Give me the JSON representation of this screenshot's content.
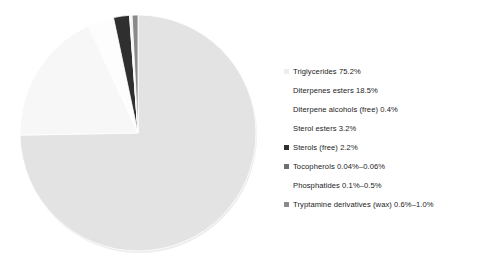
{
  "figure": {
    "background": "#ffffff",
    "pie": {
      "center_x": 120,
      "center_y": 123,
      "radius": 118,
      "start_angle_deg": 0,
      "direction": "clockwise"
    }
  },
  "legend": {
    "position": "right",
    "entries": [
      {
        "label": "Triglycerides 75.2%",
        "color": "#eeeeee",
        "marker": "square",
        "indented": false
      },
      {
        "label": "Diterpenes esters  18.5%",
        "color": "#f8f8f8",
        "marker": "square",
        "indented": true
      },
      {
        "label": "Diterpene alcohols (free) 0.4%",
        "color": "#fbfbfb",
        "marker": "square",
        "indented": true
      },
      {
        "label": "Sterol esters 3.2%",
        "color": "#fdfdfd",
        "marker": "square",
        "indented": true
      },
      {
        "label": "Sterols  (free) 2.2%",
        "color": "#2f2f2f",
        "marker": "square",
        "indented": false
      },
      {
        "label": "Tocopherols 0.04%–0.06%",
        "color": "#6f6f6f",
        "marker": "square",
        "indented": false
      },
      {
        "label": "Phosphatides 0.1%–0.5%",
        "color": "#f2f2f2",
        "marker": "square",
        "indented": true
      },
      {
        "label": "Tryptamine derivatives (wax) 0.6%–1.0%",
        "color": "#8a8a8a",
        "marker": "square",
        "indented": false
      }
    ]
  },
  "chart_data": {
    "type": "pie",
    "title": "",
    "categories": [
      "Triglycerides",
      "Diterpenes esters",
      "Diterpene alcohols (free)",
      "Sterol esters",
      "Sterols (free)",
      "Tocopherols",
      "Phosphatides",
      "Tryptamine derivatives (wax)"
    ],
    "values": [
      75.2,
      18.5,
      0.4,
      3.2,
      2.2,
      0.05,
      0.3,
      0.8
    ],
    "value_labels": [
      "75.2%",
      "18.5%",
      "0.4%",
      "3.2%",
      "2.2%",
      "0.04%–0.06%",
      "0.1%–0.5%",
      "0.6%–1.0%"
    ],
    "colors": [
      "#e3e3e3",
      "#f7f7f7",
      "#fbfbfb",
      "#fdfdfd",
      "#2f2f2f",
      "#6f6f6f",
      "#f2f2f2",
      "#8a8a8a"
    ],
    "units": "percent",
    "legend": "right",
    "grid": false,
    "xlabel": "",
    "ylabel": ""
  }
}
